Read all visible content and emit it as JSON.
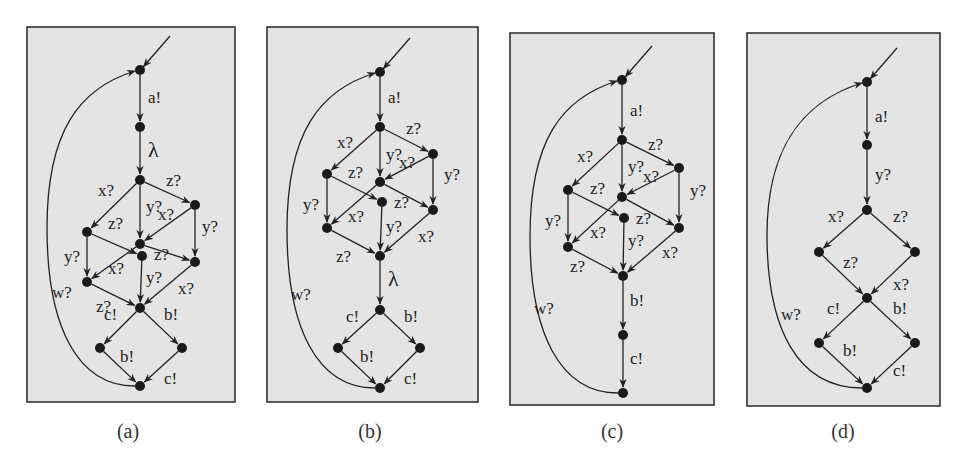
{
  "figure": {
    "panel_fill": "#e4e4e4",
    "border_color": "#333333",
    "edge_color": "#222222",
    "node_color": "#1a1a1a",
    "panels": [
      {
        "id": "a",
        "caption": "(a)",
        "box": [
          27,
          27,
          208,
          375
        ],
        "nodes": [
          [
            140,
            70
          ],
          [
            140,
            127
          ],
          [
            140,
            180
          ],
          [
            87,
            232
          ],
          [
            195,
            205
          ],
          [
            140,
            244
          ],
          [
            142,
            256
          ],
          [
            87,
            282
          ],
          [
            195,
            262
          ],
          [
            140,
            308
          ],
          [
            100,
            348
          ],
          [
            182,
            348
          ],
          [
            140,
            386
          ]
        ],
        "edges": [
          {
            "from": 1,
            "to": 2,
            "label": "a!",
            "lx": 148,
            "ly": 103
          },
          {
            "from": 2,
            "to": 3,
            "label": "λ",
            "lx": 148,
            "ly": 157,
            "big": true
          },
          {
            "from": 3,
            "to": 4,
            "label": "x?",
            "lx": 98,
            "ly": 196
          },
          {
            "from": 3,
            "to": 5,
            "label": "z?",
            "lx": 166,
            "ly": 186
          },
          {
            "from": 3,
            "to": 6,
            "label": "y?",
            "lx": 146,
            "ly": 212
          },
          {
            "from": 5,
            "to": 6,
            "label": "x?",
            "lx": 158,
            "ly": 220
          },
          {
            "from": 4,
            "to": 7,
            "label": "z?",
            "lx": 108,
            "ly": 229
          },
          {
            "from": 5,
            "to": 9,
            "label": "y?",
            "lx": 202,
            "ly": 232
          },
          {
            "from": 4,
            "to": 8,
            "label": "y?",
            "lx": 64,
            "ly": 262
          },
          {
            "from": 6,
            "to": 9,
            "label": "z?",
            "lx": 154,
            "ly": 260
          },
          {
            "from": 6,
            "to": 8,
            "label": "x?",
            "lx": 108,
            "ly": 274
          },
          {
            "from": 7,
            "to": 10,
            "label": "y?",
            "lx": 146,
            "ly": 283
          },
          {
            "from": 8,
            "to": 10,
            "label": "",
            "lx": 0,
            "ly": 0
          },
          {
            "from": 9,
            "to": 10,
            "label": "x?",
            "lx": 178,
            "ly": 294
          },
          {
            "from": 10,
            "to": 11,
            "label": "c!",
            "lx": 104,
            "ly": 320
          },
          {
            "from": 10,
            "to": 12,
            "label": "b!",
            "lx": 164,
            "ly": 320
          },
          {
            "from": 11,
            "to": 13,
            "label": "b!",
            "lx": 120,
            "ly": 362
          },
          {
            "from": 12,
            "to": 13,
            "label": "c!",
            "lx": 164,
            "ly": 384
          }
        ],
        "extra_labels": [
          {
            "text": "w?",
            "x": 52,
            "y": 298
          },
          {
            "text": "z?",
            "x": 96,
            "y": 312
          }
        ],
        "loop": {
          "from": 13,
          "to": 1,
          "label": "w?"
        }
      },
      {
        "id": "b",
        "caption": "(b)",
        "box": [
          267,
          27,
          211,
          375
        ],
        "nodes": [
          [
            380,
            72
          ],
          [
            380,
            127
          ],
          [
            327,
            174
          ],
          [
            433,
            154
          ],
          [
            380,
            182
          ],
          [
            382,
            202
          ],
          [
            327,
            228
          ],
          [
            433,
            210
          ],
          [
            380,
            256
          ],
          [
            380,
            310
          ],
          [
            338,
            348
          ],
          [
            420,
            348
          ],
          [
            380,
            388
          ]
        ],
        "edges": [
          {
            "from": 1,
            "to": 2,
            "label": "a!",
            "lx": 388,
            "ly": 103
          },
          {
            "from": 2,
            "to": 3,
            "label": "x?",
            "lx": 337,
            "ly": 148
          },
          {
            "from": 2,
            "to": 4,
            "label": "z?",
            "lx": 406,
            "ly": 134
          },
          {
            "from": 2,
            "to": 5,
            "label": "y?",
            "lx": 386,
            "ly": 160
          },
          {
            "from": 4,
            "to": 5,
            "label": "x?",
            "lx": 399,
            "ly": 168
          },
          {
            "from": 3,
            "to": 6,
            "label": "z?",
            "lx": 348,
            "ly": 178
          },
          {
            "from": 4,
            "to": 8,
            "label": "y?",
            "lx": 444,
            "ly": 180
          },
          {
            "from": 3,
            "to": 7,
            "label": "y?",
            "lx": 303,
            "ly": 210
          },
          {
            "from": 5,
            "to": 8,
            "label": "z?",
            "lx": 394,
            "ly": 208
          },
          {
            "from": 5,
            "to": 7,
            "label": "x?",
            "lx": 348,
            "ly": 222
          },
          {
            "from": 6,
            "to": 9,
            "label": "y?",
            "lx": 386,
            "ly": 232
          },
          {
            "from": 7,
            "to": 9,
            "label": "z?",
            "lx": 336,
            "ly": 262
          },
          {
            "from": 8,
            "to": 9,
            "label": "x?",
            "lx": 418,
            "ly": 242
          },
          {
            "from": 9,
            "to": 10,
            "label": "λ",
            "lx": 388,
            "ly": 286,
            "big": true
          },
          {
            "from": 10,
            "to": 11,
            "label": "c!",
            "lx": 346,
            "ly": 322
          },
          {
            "from": 10,
            "to": 12,
            "label": "b!",
            "lx": 404,
            "ly": 322
          },
          {
            "from": 11,
            "to": 13,
            "label": "b!",
            "lx": 360,
            "ly": 362
          },
          {
            "from": 12,
            "to": 13,
            "label": "c!",
            "lx": 404,
            "ly": 384
          }
        ],
        "extra_labels": [
          {
            "text": "w?",
            "x": 291,
            "y": 300
          }
        ],
        "loop": {
          "from": 13,
          "to": 1,
          "label": "w?"
        }
      },
      {
        "id": "c",
        "caption": "(c)",
        "box": [
          510,
          33,
          204,
          372
        ],
        "nodes": [
          [
            622,
            80
          ],
          [
            622,
            140
          ],
          [
            568,
            190
          ],
          [
            679,
            168
          ],
          [
            622,
            197
          ],
          [
            624,
            218
          ],
          [
            568,
            247
          ],
          [
            679,
            228
          ],
          [
            623,
            276
          ],
          [
            623,
            335
          ],
          [
            623,
            393
          ]
        ],
        "edges": [
          {
            "from": 1,
            "to": 2,
            "label": "a!",
            "lx": 630,
            "ly": 116
          },
          {
            "from": 2,
            "to": 3,
            "label": "x?",
            "lx": 577,
            "ly": 162
          },
          {
            "from": 2,
            "to": 4,
            "label": "z?",
            "lx": 648,
            "ly": 150
          },
          {
            "from": 2,
            "to": 5,
            "label": "y?",
            "lx": 628,
            "ly": 172
          },
          {
            "from": 4,
            "to": 5,
            "label": "x?",
            "lx": 643,
            "ly": 182
          },
          {
            "from": 3,
            "to": 6,
            "label": "z?",
            "lx": 590,
            "ly": 194
          },
          {
            "from": 4,
            "to": 8,
            "label": "y?",
            "lx": 690,
            "ly": 196
          },
          {
            "from": 3,
            "to": 7,
            "label": "y?",
            "lx": 545,
            "ly": 226
          },
          {
            "from": 5,
            "to": 8,
            "label": "z?",
            "lx": 636,
            "ly": 224
          },
          {
            "from": 5,
            "to": 7,
            "label": "x?",
            "lx": 590,
            "ly": 238
          },
          {
            "from": 6,
            "to": 9,
            "label": "y?",
            "lx": 628,
            "ly": 246
          },
          {
            "from": 7,
            "to": 9,
            "label": "z?",
            "lx": 570,
            "ly": 272
          },
          {
            "from": 8,
            "to": 9,
            "label": "x?",
            "lx": 662,
            "ly": 258
          },
          {
            "from": 9,
            "to": 10,
            "label": "b!",
            "lx": 630,
            "ly": 306
          },
          {
            "from": 10,
            "to": 11,
            "label": "c!",
            "lx": 630,
            "ly": 364
          }
        ],
        "extra_labels": [
          {
            "text": "w?",
            "x": 534,
            "y": 314
          }
        ],
        "loop": {
          "from": 11,
          "to": 1,
          "label": "w?"
        }
      },
      {
        "id": "d",
        "caption": "(d)",
        "box": [
          747,
          33,
          193,
          373
        ],
        "nodes": [
          [
            867,
            82
          ],
          [
            867,
            145
          ],
          [
            867,
            210
          ],
          [
            819,
            252
          ],
          [
            915,
            252
          ],
          [
            867,
            298
          ],
          [
            819,
            343
          ],
          [
            915,
            343
          ],
          [
            867,
            388
          ]
        ],
        "edges": [
          {
            "from": 1,
            "to": 2,
            "label": "a!",
            "lx": 875,
            "ly": 122
          },
          {
            "from": 2,
            "to": 3,
            "label": "y?",
            "lx": 875,
            "ly": 180
          },
          {
            "from": 3,
            "to": 4,
            "label": "x?",
            "lx": 828,
            "ly": 222
          },
          {
            "from": 3,
            "to": 5,
            "label": "z?",
            "lx": 893,
            "ly": 222
          },
          {
            "from": 4,
            "to": 6,
            "label": "z?",
            "lx": 843,
            "ly": 268
          },
          {
            "from": 5,
            "to": 6,
            "label": "x?",
            "lx": 893,
            "ly": 290
          },
          {
            "from": 6,
            "to": 7,
            "label": "c!",
            "lx": 827,
            "ly": 314
          },
          {
            "from": 6,
            "to": 8,
            "label": "b!",
            "lx": 893,
            "ly": 314
          },
          {
            "from": 7,
            "to": 9,
            "label": "b!",
            "lx": 843,
            "ly": 356
          },
          {
            "from": 8,
            "to": 9,
            "label": "c!",
            "lx": 893,
            "ly": 376
          }
        ],
        "extra_labels": [
          {
            "text": "w?",
            "x": 781,
            "y": 320
          }
        ],
        "loop": {
          "from": 9,
          "to": 1,
          "label": "w?"
        }
      }
    ]
  }
}
